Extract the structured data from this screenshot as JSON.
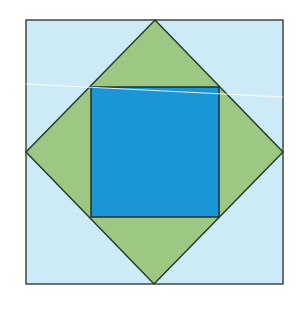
{
  "diagram": {
    "outer_square": {
      "x": 26,
      "y": 20,
      "w": 257,
      "h": 264,
      "fill": "#cdebf6",
      "stroke": "#444444"
    },
    "diamond": {
      "points": "155,20 283,152 154,284 26,152",
      "fill": "#9dc884",
      "stroke": "#2a3a2a"
    },
    "inner_square": {
      "x": 91,
      "y": 87,
      "w": 128,
      "h": 130,
      "fill": "#1a96d8",
      "stroke": "#1f2f2f"
    },
    "highlight_line": {
      "x1": 26,
      "y1": 84,
      "x2": 283,
      "y2": 97,
      "stroke": "#ffffff"
    },
    "colors": {
      "background": "#ffffff",
      "light_blue": "#cdebf6",
      "green": "#9dc884",
      "blue": "#1a96d8"
    }
  }
}
